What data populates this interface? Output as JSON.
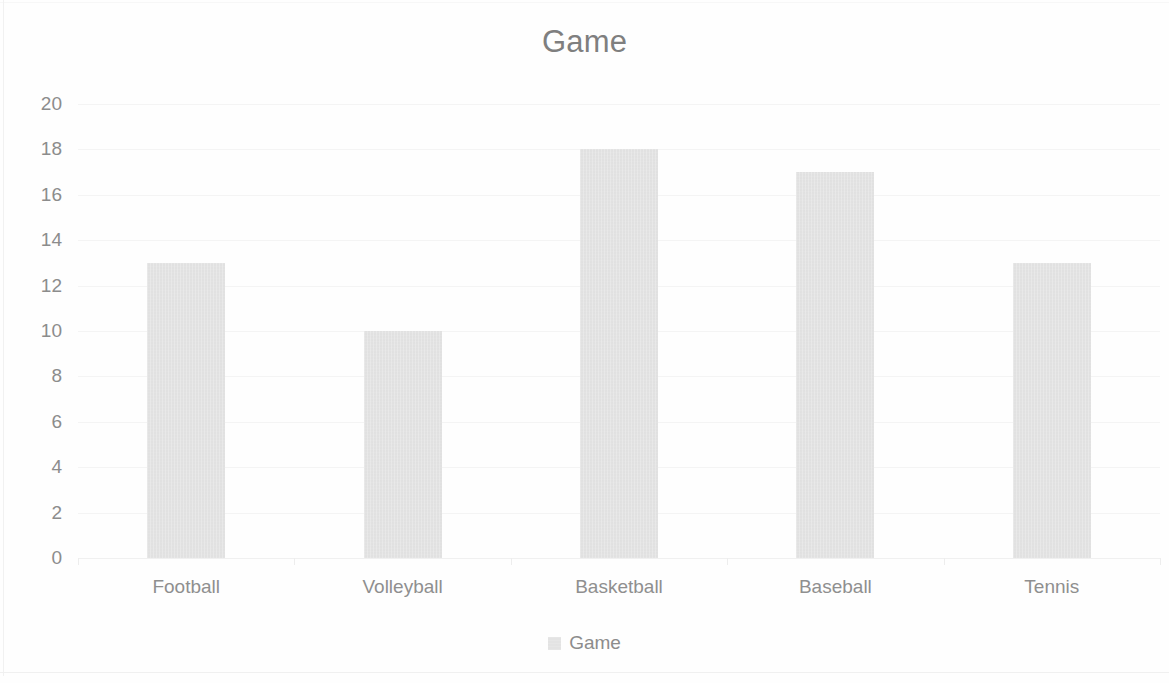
{
  "chart_data": {
    "type": "bar",
    "title": "Game",
    "xlabel": "",
    "ylabel": "",
    "categories": [
      "Football",
      "Volleyball",
      "Basketball",
      "Baseball",
      "Tennis"
    ],
    "values": [
      13,
      10,
      18,
      17,
      13
    ],
    "series": [
      {
        "name": "Game",
        "values": [
          13,
          10,
          18,
          17,
          13
        ],
        "color": "#dcdcdc"
      }
    ],
    "ylim": [
      0,
      20
    ],
    "y_tick_step": 2,
    "y_tick_labels": [
      "20",
      "18",
      "16",
      "14",
      "12",
      "10",
      "8",
      "6",
      "4",
      "2",
      "0"
    ],
    "y_tick_values": [
      20,
      18,
      16,
      14,
      12,
      10,
      8,
      6,
      4,
      2,
      0
    ],
    "grid": true,
    "grid_axis": "y",
    "legend": {
      "position": "bottom",
      "entries": [
        {
          "label": "Game",
          "color": "#dcdcdc",
          "marker": "square-swatch"
        }
      ]
    },
    "colors": {
      "bar_fill": "#dcdcdc",
      "title_text": "#7f7f7f",
      "tick_text": "#8c8c8c",
      "gridline": "#f4f4f4",
      "background": "#fefefe"
    }
  }
}
